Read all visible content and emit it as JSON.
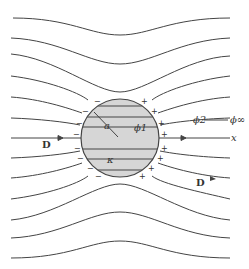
{
  "figure": {
    "labels": {
      "radius": "a",
      "phi_inside": "ϕ1",
      "phi_outside": "ϕ2",
      "phi_infinity": "ϕ∞",
      "x_axis": "x",
      "field_left": "D",
      "field_right": "D",
      "permittivity": "κ"
    },
    "charges": {
      "negative": "−",
      "positive": "+"
    },
    "colors": {
      "line": "#444444",
      "sphere_fill": "#d6d6d6",
      "sphere_stroke": "#444444",
      "background": "#ffffff"
    }
  }
}
